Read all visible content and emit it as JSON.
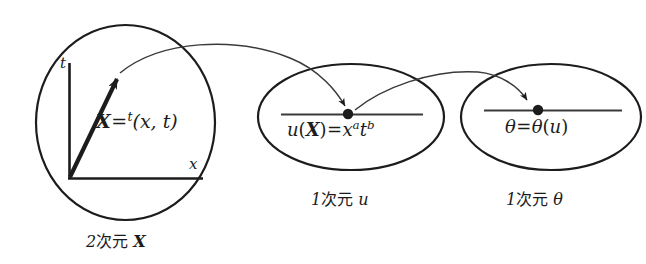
{
  "diagram": {
    "stroke_color": "#1c1c1c",
    "background": "#ffffff",
    "sets": [
      {
        "id": "domain-x",
        "shape": "circle",
        "caption_prefix": "2",
        "caption_jp": "次元",
        "caption_symbol": "X",
        "caption_full": "2次元 X",
        "axes": {
          "vertical_label": "t",
          "horizontal_label": "x"
        },
        "equation": {
          "lhs": "X",
          "relation": "=",
          "presuperscript": "t",
          "rhs": "(x, t)",
          "full": "X = ᵗ(x, t)"
        }
      },
      {
        "id": "set-u",
        "shape": "ellipse",
        "caption_prefix": "1",
        "caption_jp": "次元",
        "caption_symbol": "u",
        "caption_full": "1次元 u",
        "equation": {
          "lhs_fn": "u",
          "lhs_arg": "X",
          "relation": "=",
          "rhs_base1": "x",
          "rhs_exp1": "a",
          "rhs_base2": "t",
          "rhs_exp2": "b",
          "full": "u(X) = xᵃtᵇ"
        }
      },
      {
        "id": "set-theta",
        "shape": "ellipse",
        "caption_prefix": "1",
        "caption_jp": "次元",
        "caption_symbol": "θ",
        "caption_full": "1次元 θ",
        "equation": {
          "lhs": "θ",
          "relation": "=",
          "rhs_fn": "θ",
          "rhs_arg": "u",
          "full": "θ = θ(u)"
        }
      }
    ],
    "arrows": [
      {
        "id": "arrow-x-to-u",
        "from": "domain-x",
        "to": "set-u",
        "style": "curved-thin-arrow"
      },
      {
        "id": "arrow-u-to-theta",
        "from": "set-u",
        "to": "set-theta",
        "style": "curved-thin-arrow"
      }
    ]
  }
}
